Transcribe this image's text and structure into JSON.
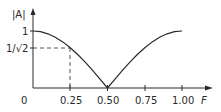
{
  "chart_data": {
    "type": "line",
    "title": "",
    "xlabel": "F",
    "ylabel": "|A|",
    "xlim": [
      0,
      1.05
    ],
    "ylim": [
      0,
      1.1
    ],
    "x_ticks": [
      "0",
      "0.25",
      "0.50",
      "0.75",
      "1.00"
    ],
    "y_ticks": [
      "1",
      "1/√2"
    ],
    "grid": false,
    "legend": null,
    "series": [
      {
        "name": "|A| = |cos(πF)|",
        "x": [
          0.0,
          0.05,
          0.1,
          0.15,
          0.2,
          0.25,
          0.3,
          0.35,
          0.4,
          0.45,
          0.5,
          0.55,
          0.6,
          0.65,
          0.7,
          0.75,
          0.8,
          0.85,
          0.9,
          0.95,
          1.0
        ],
        "values": [
          1.0,
          0.988,
          0.951,
          0.891,
          0.809,
          0.707,
          0.588,
          0.454,
          0.309,
          0.156,
          0.0,
          0.156,
          0.309,
          0.454,
          0.588,
          0.707,
          0.809,
          0.891,
          0.951,
          0.988,
          1.0
        ]
      }
    ],
    "annotations": [
      {
        "type": "dashed-guide",
        "x": 0.25,
        "y": 0.7071,
        "label": "1/√2 at F = 0.25"
      }
    ]
  },
  "labels": {
    "y_axis": "|A|",
    "x_axis": "F",
    "origin": "0",
    "y_one": "1",
    "y_inv_sqrt2": "1/√2",
    "x_025": "0.25",
    "x_050": "0.50",
    "x_075": "0.75",
    "x_100": "1.00"
  },
  "colors": {
    "line": "#2a2a2a",
    "background": "#ffffff"
  }
}
